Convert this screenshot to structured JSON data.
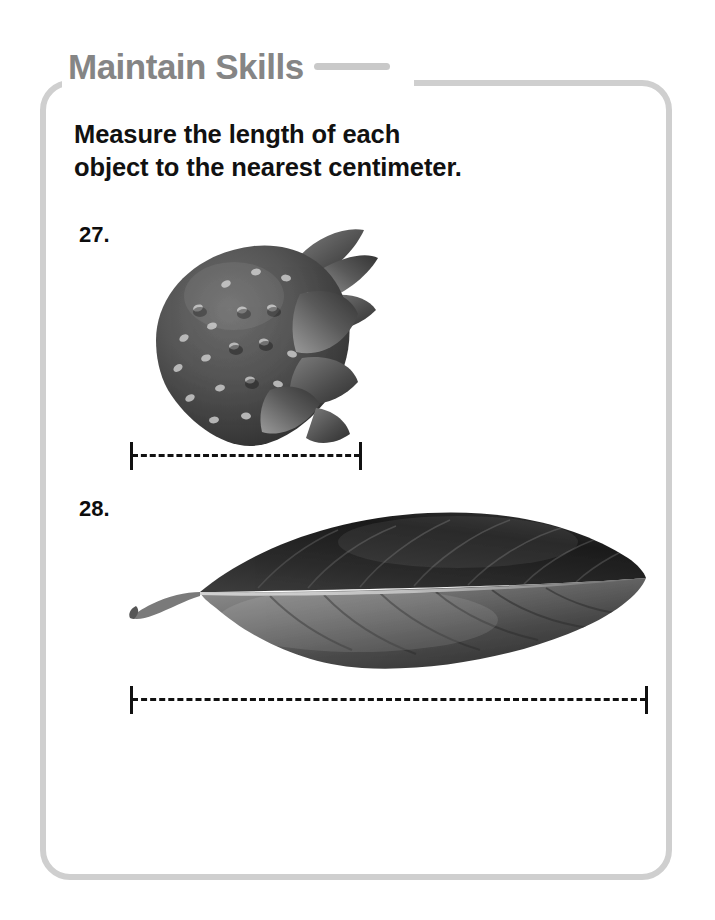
{
  "page": {
    "background_color": "#ffffff",
    "frame_color": "#cfcfcf"
  },
  "header": {
    "title": "Maintain Skills",
    "title_color": "#858585",
    "rule_color": "#c9c9c9",
    "rule_icon": "horizontal-rule-icon"
  },
  "instructions": {
    "line1": "Measure the length of each",
    "line2": "object to the nearest centimeter.",
    "full_text": "Measure the length of each object to the nearest centimeter."
  },
  "problems": [
    {
      "number": "27.",
      "figure": {
        "name": "strawberry-photo",
        "alt": "Grayscale photograph of a strawberry with seeds and sepals",
        "object": "strawberry"
      },
      "measure_line": {
        "name": "measure-line-27",
        "style": "dashed-with-end-caps",
        "color": "#111111"
      }
    },
    {
      "number": "28.",
      "figure": {
        "name": "leaf-photo",
        "alt": "Grayscale photograph of a magnolia leaf with midrib and veins",
        "object": "leaf"
      },
      "measure_line": {
        "name": "measure-line-28",
        "style": "dashed-with-end-caps",
        "color": "#111111"
      }
    }
  ]
}
